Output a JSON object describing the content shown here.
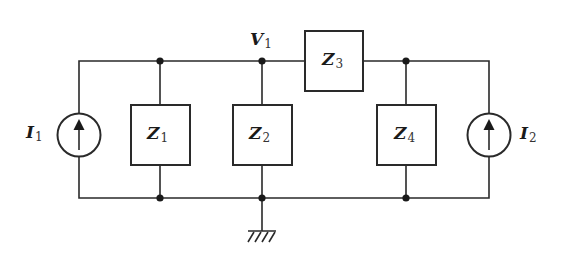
{
  "diagram": {
    "type": "circuit-schematic",
    "colors": {
      "line": "#2a2a2a",
      "background": "#ffffff"
    },
    "labels": {
      "I1": {
        "main": "I",
        "sub": "1"
      },
      "I2": {
        "main": "I",
        "sub": "2"
      },
      "Z1": {
        "main": "Z",
        "sub": "1"
      },
      "Z2": {
        "main": "Z",
        "sub": "2"
      },
      "Z3": {
        "main": "Z",
        "sub": "3"
      },
      "Z4": {
        "main": "Z",
        "sub": "4"
      },
      "V1": {
        "main": "V",
        "sub": "1"
      }
    },
    "components": [
      {
        "id": "I1",
        "kind": "current-source",
        "direction": "up"
      },
      {
        "id": "Z1",
        "kind": "impedance",
        "connection": "shunt"
      },
      {
        "id": "Z2",
        "kind": "impedance",
        "connection": "shunt",
        "node": "V1"
      },
      {
        "id": "Z3",
        "kind": "impedance",
        "connection": "series"
      },
      {
        "id": "Z4",
        "kind": "impedance",
        "connection": "shunt"
      },
      {
        "id": "I2",
        "kind": "current-source",
        "direction": "up"
      }
    ],
    "ground": {
      "symbol": "chassis-ground"
    }
  }
}
